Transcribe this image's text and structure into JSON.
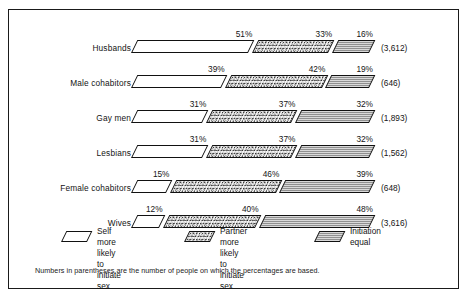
{
  "chart_data": {
    "type": "bar",
    "subtype": "stacked-horizontal-percentage",
    "title": "",
    "xlabel": "",
    "ylabel": "",
    "xlim": [
      0,
      100
    ],
    "grid": false,
    "legend_position": "bottom",
    "categories": [
      "Husbands",
      "Male cohabitors",
      "Gay men",
      "Lesbians",
      "Female cohabitors",
      "Wives"
    ],
    "series": [
      {
        "name": "Self more likely to initiate sex",
        "key": "self",
        "values": [
          51,
          39,
          31,
          31,
          15,
          12
        ]
      },
      {
        "name": "Partner more likely to initiate sex",
        "key": "partner",
        "values": [
          33,
          42,
          37,
          37,
          46,
          40
        ]
      },
      {
        "name": "Initiation equal",
        "key": "equal",
        "values": [
          16,
          19,
          32,
          32,
          39,
          48
        ]
      }
    ],
    "sample_sizes": [
      "(3,612)",
      "(646)",
      "(1,893)",
      "(1,562)",
      "(648)",
      "(3,616)"
    ],
    "value_suffix": "%",
    "annotations": [
      "Numbers in parentheses are the number of people on which the percentages are based."
    ]
  },
  "rows": [
    {
      "label": "Husbands",
      "n": "(3,612)",
      "segments": [
        {
          "key": "self",
          "label": "51%",
          "value": 51
        },
        {
          "key": "partner",
          "label": "33%",
          "value": 33
        },
        {
          "key": "equal",
          "label": "16%",
          "value": 16
        }
      ]
    },
    {
      "label": "Male cohabitors",
      "n": "(646)",
      "segments": [
        {
          "key": "self",
          "label": "39%",
          "value": 39
        },
        {
          "key": "partner",
          "label": "42%",
          "value": 42
        },
        {
          "key": "equal",
          "label": "19%",
          "value": 19
        }
      ]
    },
    {
      "label": "Gay men",
      "n": "(1,893)",
      "segments": [
        {
          "key": "self",
          "label": "31%",
          "value": 31
        },
        {
          "key": "partner",
          "label": "37%",
          "value": 37
        },
        {
          "key": "equal",
          "label": "32%",
          "value": 32
        }
      ]
    },
    {
      "label": "Lesbians",
      "n": "(1,562)",
      "segments": [
        {
          "key": "self",
          "label": "31%",
          "value": 31
        },
        {
          "key": "partner",
          "label": "37%",
          "value": 37
        },
        {
          "key": "equal",
          "label": "32%",
          "value": 32
        }
      ]
    },
    {
      "label": "Female cohabitors",
      "n": "(648)",
      "segments": [
        {
          "key": "self",
          "label": "15%",
          "value": 15
        },
        {
          "key": "partner",
          "label": "46%",
          "value": 46
        },
        {
          "key": "equal",
          "label": "39%",
          "value": 39
        }
      ]
    },
    {
      "label": "Wives",
      "n": "(3,616)",
      "segments": [
        {
          "key": "self",
          "label": "12%",
          "value": 12
        },
        {
          "key": "partner",
          "label": "40%",
          "value": 40
        },
        {
          "key": "equal",
          "label": "48%",
          "value": 48
        }
      ]
    }
  ],
  "legend": {
    "items": [
      {
        "key": "self",
        "text": "Self more likely\nto initiate sex",
        "swatch": "parallelogram-white"
      },
      {
        "key": "partner",
        "text": "Partner more likely\nto initiate sex",
        "swatch": "parallelogram-stipple"
      },
      {
        "key": "equal",
        "text": "Initiation equal",
        "swatch": "parallelogram-crosshatch"
      }
    ]
  },
  "footnote": "Numbers in parentheses are the number of people on which the percentages are based.",
  "colors": {
    "frame": "#1a1a1a",
    "text": "#141414",
    "background": "#ffffff",
    "self_fill": "#ffffff",
    "partner_fill": "#f4f4f4",
    "equal_fill": "#d9d9d9"
  }
}
